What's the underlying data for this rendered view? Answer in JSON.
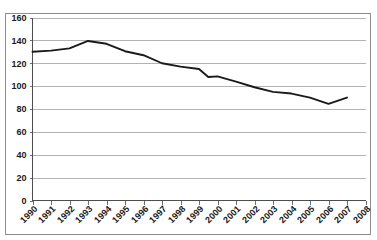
{
  "chart_data": {
    "type": "line",
    "title": "",
    "subtitle": "",
    "xlabel": "",
    "ylabel": "",
    "x": [
      1990,
      1991,
      1992,
      1993,
      1994,
      1995,
      1996,
      1997,
      1998,
      1999,
      2000,
      2001,
      2002,
      2003,
      2004,
      2005,
      2006,
      2007
    ],
    "categories": [
      "1990",
      "1991",
      "1992",
      "1993",
      "1994",
      "1995",
      "1996",
      "1997",
      "1998",
      "1999",
      "2000",
      "2001",
      "2002",
      "2003",
      "2004",
      "2005",
      "2006",
      "2007",
      "2008"
    ],
    "values": [
      130,
      131,
      133,
      139.5,
      137,
      130.5,
      127,
      120,
      117,
      115,
      108,
      108.5,
      104,
      99,
      95,
      93.5,
      90,
      84.5,
      90
    ],
    "series": [
      {
        "name": "series-1",
        "color": "#1a1a1a",
        "points": [
          {
            "x": "1990",
            "y": 130
          },
          {
            "x": "1991",
            "y": 131
          },
          {
            "x": "1992",
            "y": 133
          },
          {
            "x": "1993",
            "y": 139.5
          },
          {
            "x": "1994",
            "y": 137
          },
          {
            "x": "1995",
            "y": 130.5
          },
          {
            "x": "1996",
            "y": 127
          },
          {
            "x": "1997",
            "y": 120
          },
          {
            "x": "1998",
            "y": 117
          },
          {
            "x": "1999",
            "y": 115
          },
          {
            "x": "1999.5",
            "y": 108
          },
          {
            "x": "2000",
            "y": 108.5
          },
          {
            "x": "2001",
            "y": 104
          },
          {
            "x": "2002",
            "y": 99
          },
          {
            "x": "2003",
            "y": 95
          },
          {
            "x": "2004",
            "y": 93.5
          },
          {
            "x": "2005",
            "y": 90
          },
          {
            "x": "2006",
            "y": 84.5
          },
          {
            "x": "2007",
            "y": 90
          }
        ]
      }
    ],
    "xticklabels": [
      "1990",
      "1991",
      "1992",
      "1993",
      "1994",
      "1995",
      "1996",
      "1997",
      "1998",
      "1999",
      "2000",
      "2001",
      "2002",
      "2003",
      "2004",
      "2005",
      "2006",
      "2007",
      "2008"
    ],
    "yticklabels": [
      "0",
      "20",
      "40",
      "60",
      "80",
      "100",
      "120",
      "140",
      "160"
    ],
    "yticks": [
      0,
      20,
      40,
      60,
      80,
      100,
      120,
      140,
      160
    ],
    "ylim": [
      0,
      160
    ],
    "xlim": [
      "1990",
      "2008"
    ],
    "grid": "horizontal",
    "legend": "none",
    "legend_position": "",
    "gridline_color": "#b3b3b3",
    "axis_color": "#4d4d4d",
    "line_color": "#1a1a1a",
    "background_color": "#ffffff",
    "xtick_rotation": -45,
    "annotations": []
  }
}
